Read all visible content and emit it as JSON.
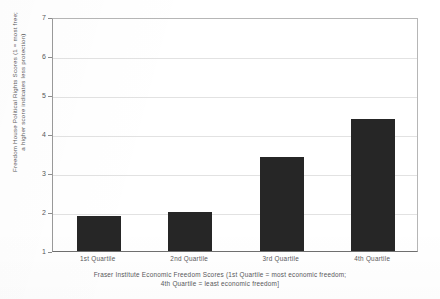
{
  "chart_data": {
    "type": "bar",
    "title": "",
    "subtitle": "",
    "categories": [
      "1st Quartile",
      "2nd Quartile",
      "3rd Quartile",
      "4th Quartile"
    ],
    "values": [
      1.9,
      2.0,
      3.4,
      4.38
    ],
    "series": [
      {
        "name": "Freedom House Political Rights Score",
        "values": [
          1.9,
          2.0,
          3.4,
          4.38
        ]
      }
    ],
    "xlabel": "Fraser Institute Economic Freedom Scores (1st Quartile = most economic freedom; 4th Quartile = least economic freedom]",
    "xlabel_lines": [
      "Fraser Institute Economic Freedom Scores (1st Quartile = most economic freedom;",
      "4th Quartile = least economic freedom]"
    ],
    "ylabel": "Freedom House Political Rights Scores (1 = most free; a higher score indicates less protection)",
    "ylabel_lines": [
      "Freedom House Political Rights Scores (1 = most free;",
      "a higher score indicates less protection)"
    ],
    "ylim": [
      1,
      7
    ],
    "yticks": [
      1,
      2,
      3,
      4,
      5,
      6,
      7
    ],
    "ytick_labels": [
      "1",
      "2",
      "3",
      "4",
      "5",
      "6",
      "7"
    ],
    "grid": "horizontal",
    "legend": "none",
    "bar_color": "#262626",
    "gridline_color": "#e2e2e2",
    "axis_color": "#6f6f6f",
    "text_color": "#58585a",
    "background_color": "#ffffff"
  }
}
